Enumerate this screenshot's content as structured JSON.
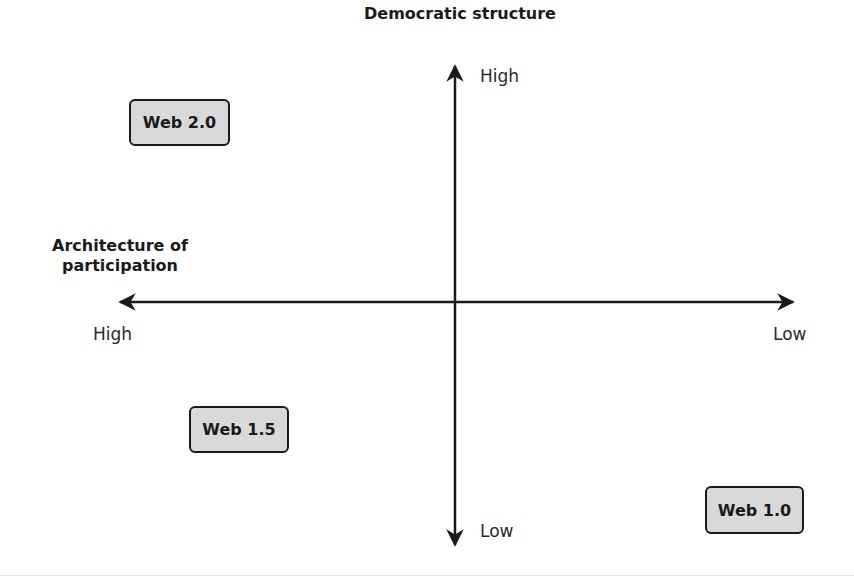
{
  "diagram": {
    "type": "quadrant",
    "vertical_axis": {
      "title": "Democratic structure",
      "top_label": "High",
      "bottom_label": "Low"
    },
    "horizontal_axis": {
      "title_line1": "Architecture of",
      "title_line2": "participation",
      "left_label": "High",
      "right_label": "Low"
    },
    "nodes": [
      {
        "label": "Web 2.0",
        "quadrant": "top-left"
      },
      {
        "label": "Web 1.5",
        "quadrant": "bottom-left"
      },
      {
        "label": "Web 1.0",
        "quadrant": "bottom-right"
      }
    ],
    "colors": {
      "box_fill": "#d9d9d9",
      "stroke": "#1a1a1a"
    }
  }
}
